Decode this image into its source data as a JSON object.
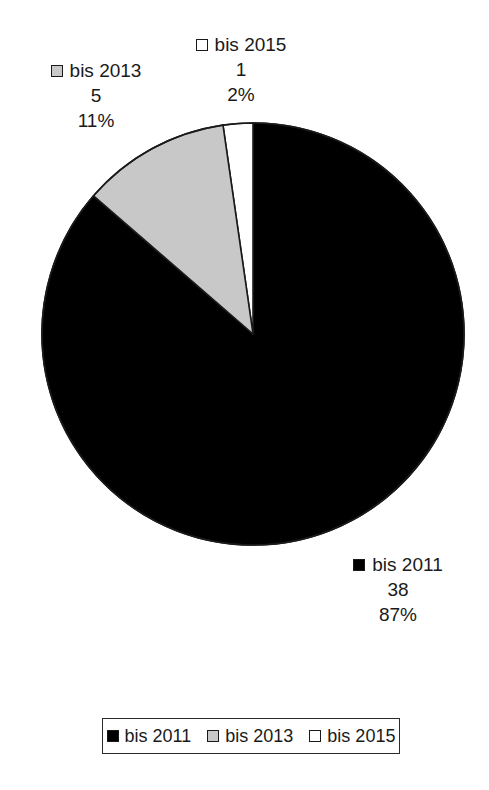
{
  "chart_data": {
    "type": "pie",
    "title": "",
    "categories": [
      "bis 2011",
      "bis 2013",
      "bis 2015"
    ],
    "values": [
      38,
      5,
      1
    ],
    "percentages": [
      "87%",
      "11%",
      "2%"
    ],
    "total": 44,
    "start_angle_deg": 0,
    "direction": "clockwise",
    "legend_position": "bottom",
    "grid": false,
    "slices": [
      {
        "label": "bis 2011",
        "value": 38,
        "value_text": "38",
        "percent_text": "87%",
        "percent": 87,
        "color": "#000000",
        "swatch": "black-swatch-icon"
      },
      {
        "label": "bis 2013",
        "value": 5,
        "value_text": "5",
        "percent_text": "11%",
        "percent": 11,
        "color": "#c8c8c8",
        "swatch": "gray-swatch-icon"
      },
      {
        "label": "bis 2015",
        "value": 1,
        "value_text": "1",
        "percent_text": "2%",
        "percent": 2,
        "color": "#ffffff",
        "swatch": "white-swatch-icon"
      }
    ]
  },
  "legend": {
    "items": [
      {
        "label": "bis 2011",
        "color": "#000000"
      },
      {
        "label": "bis 2013",
        "color": "#c8c8c8"
      },
      {
        "label": "bis 2015",
        "color": "#ffffff"
      }
    ]
  },
  "colors": {
    "outline": "#1a1a1a",
    "background": "#ffffff",
    "slice_black": "#000000",
    "slice_gray": "#c8c8c8",
    "slice_white": "#ffffff"
  }
}
